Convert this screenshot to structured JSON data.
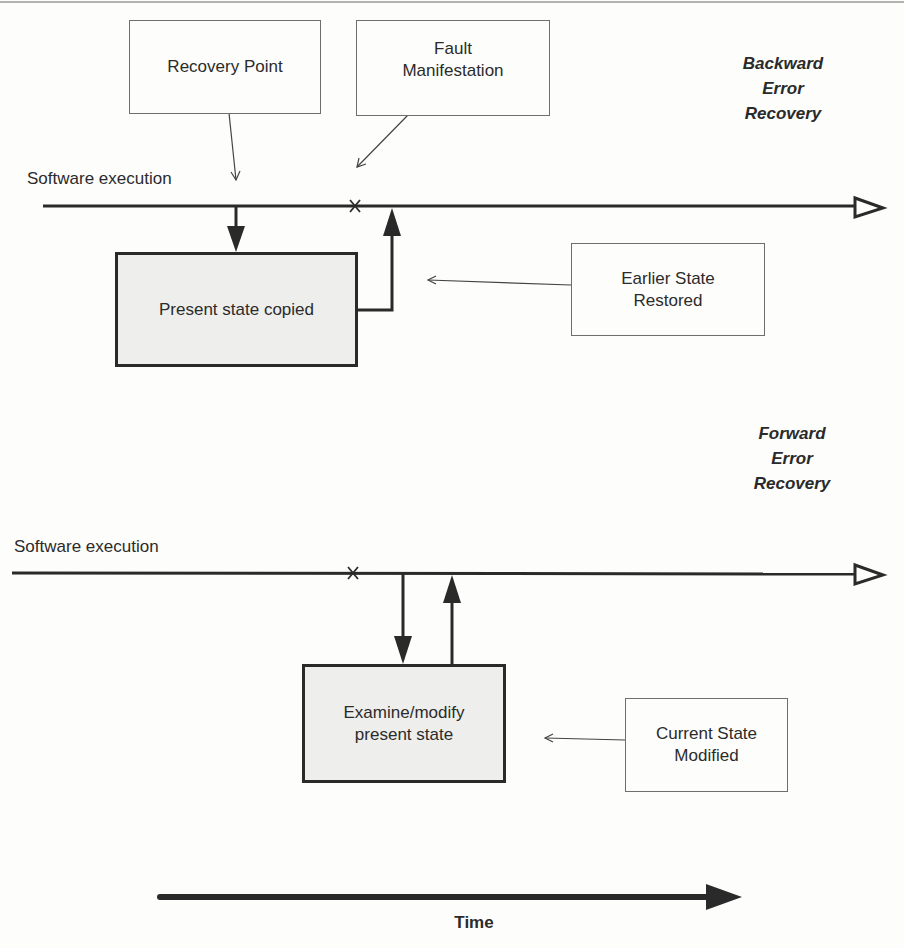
{
  "backward": {
    "title": "Backward\nError\nRecovery",
    "execution_label": "Software execution",
    "recovery_point": "Recovery Point",
    "fault_manifestation": "Fault\nManifestation",
    "process_box": "Present state copied",
    "annotation": "Earlier State\nRestored",
    "fault_marker": "x"
  },
  "forward": {
    "title": "Forward\nError\nRecovery",
    "execution_label": "Software execution",
    "process_box": "Examine/modify\npresent state",
    "annotation": "Current State\nModified",
    "fault_marker": "x"
  },
  "time_axis": {
    "label": "Time"
  },
  "colors": {
    "line": "#2a2a2a",
    "box_fill": "#eeeeec",
    "background": "#fdfdfb"
  }
}
